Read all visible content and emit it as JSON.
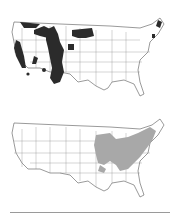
{
  "figure": {
    "maps": [
      {
        "id": "top",
        "description": "US map with dark shaded regions in the western mountain states and northern Maine",
        "fill_color": "#2b2b2b",
        "regions": [
          "Pacific Northwest Cascades",
          "Sierra Nevada",
          "Northern Rockies",
          "Central Rockies",
          "Black Hills",
          "Northern Plains Montana/North Dakota",
          "Northern Maine"
        ]
      },
      {
        "id": "bottom",
        "description": "US map with light gray shaded regions across the Midwest, Ohio Valley, Appalachians and Northeast",
        "fill_color": "#a8a8a8",
        "regions": [
          "Upper Midwest",
          "Ohio Valley",
          "Appalachians",
          "Northeast",
          "New England"
        ]
      }
    ]
  }
}
